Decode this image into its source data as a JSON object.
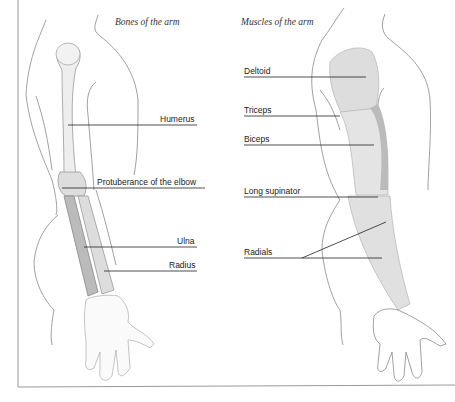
{
  "bones": {
    "title": "Bones of the arm",
    "labels": {
      "humerus": "Humerus",
      "elbow": "Protuberance of the elbow",
      "ulna": "Ulna",
      "radius": "Radius"
    }
  },
  "muscles": {
    "title": "Muscles of the arm",
    "labels": {
      "deltoid": "Deltoid",
      "triceps": "Triceps",
      "biceps": "Biceps",
      "long_supinator": "Long supinator",
      "radials": "Radials"
    }
  }
}
